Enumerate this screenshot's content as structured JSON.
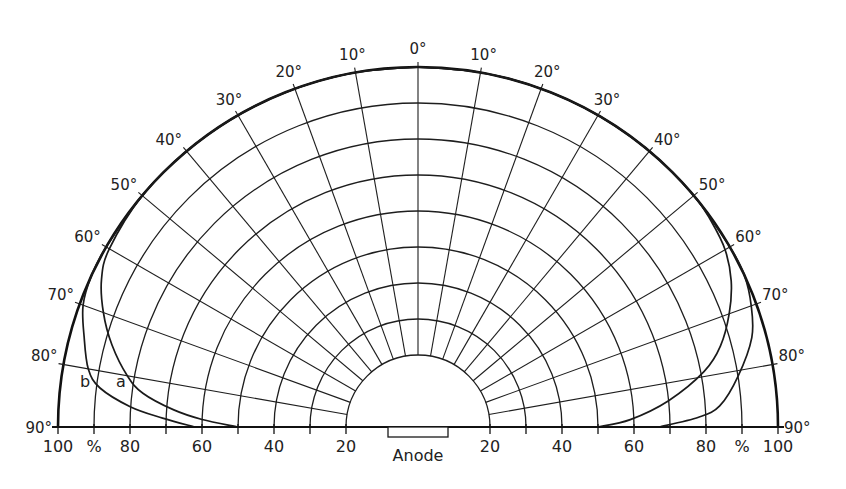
{
  "chart_data": {
    "type": "polar-half",
    "title": "",
    "radial_axis": {
      "unit": "%",
      "range": [
        20,
        100
      ],
      "grid_values": [
        20,
        30,
        40,
        50,
        60,
        70,
        80,
        90,
        100
      ],
      "tick_labels_left": [
        "100",
        "%",
        "80",
        "60",
        "40",
        "20"
      ],
      "tick_labels_right": [
        "20",
        "40",
        "60",
        "80",
        "%",
        "100"
      ]
    },
    "angular_axis": {
      "unit": "deg",
      "zero": "up",
      "grid_angles": [
        0,
        10,
        20,
        30,
        40,
        50,
        60,
        70,
        80,
        90
      ],
      "labels_left": [
        "0°",
        "10°",
        "20°",
        "30°",
        "40°",
        "50°",
        "60°",
        "70°",
        "80°",
        "90°"
      ],
      "labels_right": [
        "10°",
        "20°",
        "30°",
        "40°",
        "50°",
        "60°",
        "70°",
        "80°",
        "90°"
      ]
    },
    "center_label": "Anode",
    "series": [
      {
        "name": "a",
        "side": "left",
        "angles": [
          0,
          10,
          20,
          30,
          40,
          50,
          60,
          65,
          70,
          75,
          80,
          83,
          86,
          88,
          90
        ],
        "values": [
          100,
          100,
          100,
          100,
          100,
          100,
          99,
          97,
          93,
          88,
          82,
          77,
          68,
          60,
          50
        ]
      },
      {
        "name": "b",
        "side": "left",
        "angles": [
          0,
          10,
          20,
          30,
          40,
          50,
          60,
          65,
          70,
          75,
          80,
          83,
          86,
          88,
          90
        ],
        "values": [
          100,
          100,
          100,
          100,
          100,
          100,
          100,
          100,
          99,
          96,
          93,
          89,
          80,
          71,
          62
        ]
      },
      {
        "name": "inner (right side)",
        "side": "right",
        "angles": [
          0,
          10,
          20,
          30,
          40,
          50,
          55,
          60,
          65,
          70,
          75,
          79,
          84,
          88,
          90
        ],
        "values": [
          100,
          100,
          100,
          100,
          100,
          100,
          99.5,
          98.5,
          96,
          92,
          87,
          81,
          70,
          59,
          50
        ]
      },
      {
        "name": "outer (right side)",
        "side": "right",
        "angles": [
          0,
          10,
          20,
          30,
          40,
          50,
          60,
          65,
          70,
          75,
          81,
          86,
          88,
          90
        ],
        "values": [
          100,
          100,
          100,
          100,
          100,
          100,
          100,
          100,
          98.5,
          96,
          90,
          84,
          78,
          67
        ]
      }
    ]
  },
  "labels": {
    "curve_a": "a",
    "curve_b": "b",
    "anode": "Anode",
    "deg90_left": "90°",
    "deg90_right": "90°"
  }
}
